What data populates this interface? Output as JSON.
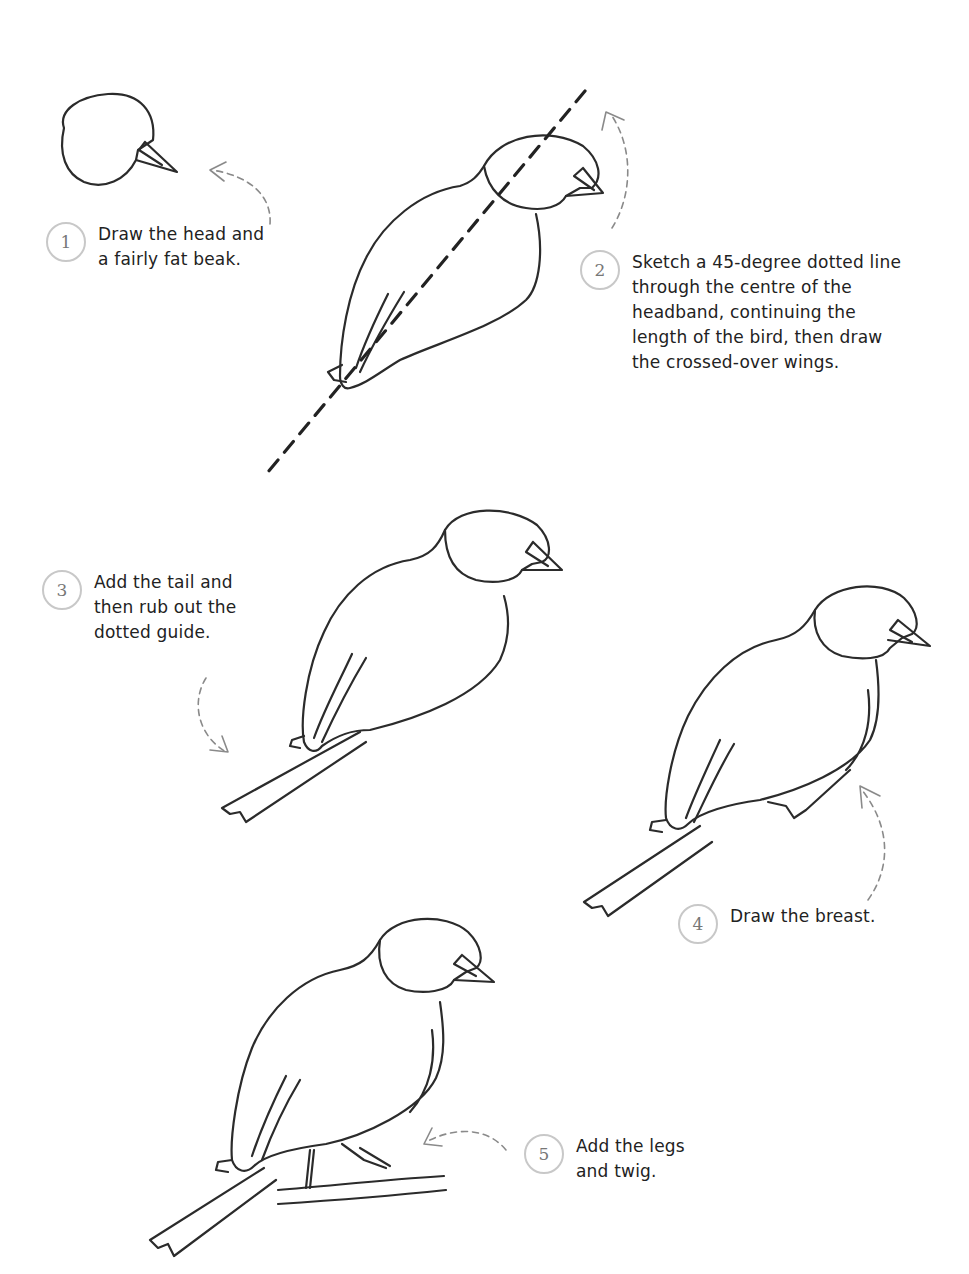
{
  "steps": [
    {
      "number": "1",
      "text": "Draw the head and\na fairly fat beak."
    },
    {
      "number": "2",
      "text": "Sketch a 45-degree dotted line\nthrough the centre of the\nheadband, continuing the\nlength of the bird, then draw\nthe crossed-over wings."
    },
    {
      "number": "3",
      "text": "Add the tail and\nthen rub out the\ndotted guide."
    },
    {
      "number": "4",
      "text": "Draw the breast."
    },
    {
      "number": "5",
      "text": "Add the legs\nand twig."
    }
  ],
  "illustrations": [
    {
      "step": "1",
      "subject": "head-and-beak"
    },
    {
      "step": "2",
      "subject": "body-with-45-degree-guide-and-wings"
    },
    {
      "step": "3",
      "subject": "bird-with-tail"
    },
    {
      "step": "4",
      "subject": "bird-with-breast"
    },
    {
      "step": "5",
      "subject": "bird-with-legs-on-twig"
    }
  ],
  "colors": {
    "ink": "#2b2b2b",
    "badge_border": "#c8c8c8",
    "badge_text": "#777777",
    "arrow": "#8a8a8a",
    "background": "#ffffff"
  }
}
